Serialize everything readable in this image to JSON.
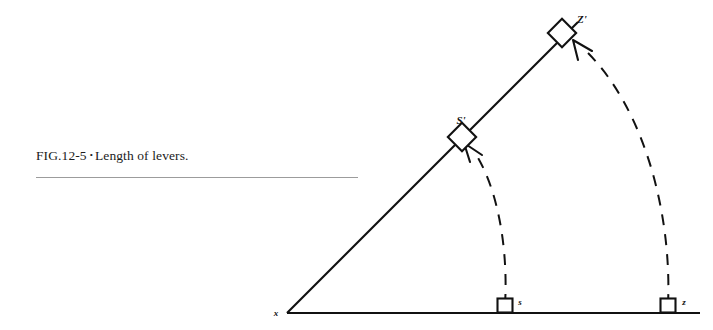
{
  "page": {
    "width": 713,
    "height": 330,
    "background": "#ffffff"
  },
  "caption": {
    "fig_id": "FIG.12-5",
    "bullet": "•",
    "text": "Length of levers.",
    "full_text": "FIG.12-5 • Length of levers.",
    "rule_color": "#9c9c9c"
  },
  "diagram": {
    "ink_color": "#111111",
    "type": "geometric-lever-diagram",
    "vertex": {
      "label": "x",
      "x": 287,
      "y": 313
    },
    "baseline": {
      "name": "horizontal-baseline",
      "x1": 287,
      "y1": 313,
      "x2": 700,
      "y2": 313
    },
    "ray": {
      "name": "diagonal-ray",
      "x1": 287,
      "y1": 313,
      "x2": 578,
      "y2": 22
    },
    "baseline_markers": [
      {
        "label": "s",
        "x": 505,
        "y": 313,
        "size": 15
      },
      {
        "label": "z",
        "x": 668,
        "y": 313,
        "size": 15
      }
    ],
    "ray_markers": [
      {
        "label": "S'",
        "x": 462,
        "y": 137,
        "size": 13
      },
      {
        "label": "Z'",
        "x": 562,
        "y": 33,
        "size": 13
      }
    ],
    "arcs": [
      {
        "name": "inner-arc",
        "from": "s",
        "to": "S'",
        "dashed": true,
        "arrowhead": "chevron-up-left"
      },
      {
        "name": "outer-arc",
        "from": "z",
        "to": "Z'",
        "dashed": true,
        "arrowhead": "chevron-up-left"
      }
    ]
  }
}
